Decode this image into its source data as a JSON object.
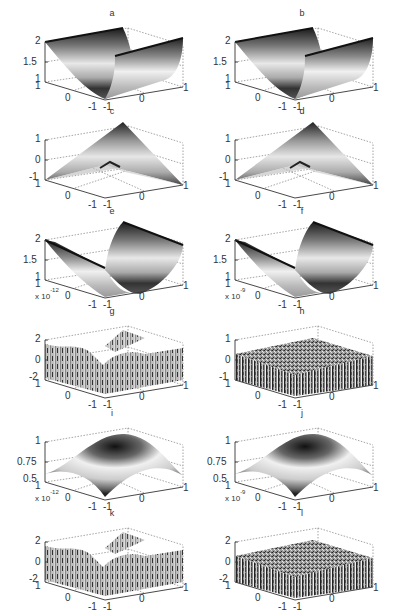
{
  "figure": {
    "layout": "6 rows x 2 columns of 3D surface plots",
    "panels": [
      {
        "id": "a",
        "title": "a",
        "type": "valley",
        "zticks": [
          "2",
          "1.5",
          "1"
        ],
        "yticks": [
          "1",
          "0",
          "-1"
        ],
        "xticks": [
          "-1",
          "0",
          "1"
        ],
        "exponent": ""
      },
      {
        "id": "b",
        "title": "b",
        "type": "valley",
        "zticks": [
          "2",
          "1.5",
          "1"
        ],
        "yticks": [
          "1",
          "0",
          "-1"
        ],
        "xticks": [
          "-1",
          "0",
          "1"
        ],
        "exponent": ""
      },
      {
        "id": "c",
        "title": "c",
        "type": "pyramid",
        "zticks": [
          "1",
          "0",
          "-1"
        ],
        "yticks": [
          "1",
          "0",
          "-1"
        ],
        "xticks": [
          "-1",
          "0",
          "1"
        ],
        "exponent": ""
      },
      {
        "id": "d",
        "title": "d",
        "type": "pyramid",
        "zticks": [
          "1",
          "0",
          "-1"
        ],
        "yticks": [
          "1",
          "0",
          "-1"
        ],
        "xticks": [
          "-1",
          "0",
          "1"
        ],
        "exponent": ""
      },
      {
        "id": "e",
        "title": "e",
        "type": "valley2",
        "zticks": [
          "2",
          "1.5",
          "1"
        ],
        "yticks": [
          "1",
          "0",
          "-1"
        ],
        "xticks": [
          "-1",
          "0",
          "1"
        ],
        "exponent": ""
      },
      {
        "id": "f",
        "title": "f",
        "type": "valley2",
        "zticks": [
          "2",
          "1.5",
          "1"
        ],
        "yticks": [
          "1",
          "0",
          "-1"
        ],
        "xticks": [
          "-1",
          "0",
          "1"
        ],
        "exponent": ""
      },
      {
        "id": "g",
        "title": "g",
        "type": "noise-wave",
        "zticks": [
          "2",
          "0",
          "-2"
        ],
        "yticks": [
          "1",
          "0",
          "-1"
        ],
        "xticks": [
          "-1",
          "0",
          "1"
        ],
        "exponent": "x 10",
        "exponent_power": "-12"
      },
      {
        "id": "h",
        "title": "h",
        "type": "noise",
        "zticks": [
          "1",
          "0",
          "-1"
        ],
        "yticks": [
          "1",
          "0",
          "-1"
        ],
        "xticks": [
          "-1",
          "0",
          "1"
        ],
        "exponent": "x 10",
        "exponent_power": "-9"
      },
      {
        "id": "i",
        "title": "i",
        "type": "dome",
        "zticks": [
          "1",
          "0.75",
          "0.5"
        ],
        "yticks": [
          "1",
          "0",
          "-1"
        ],
        "xticks": [
          "-1",
          "0",
          "1"
        ],
        "exponent": ""
      },
      {
        "id": "j",
        "title": "j",
        "type": "dome",
        "zticks": [
          "1",
          "0.75",
          "0.5"
        ],
        "yticks": [
          "1",
          "0",
          "-1"
        ],
        "xticks": [
          "-1",
          "0",
          "1"
        ],
        "exponent": ""
      },
      {
        "id": "k",
        "title": "k",
        "type": "noise-wave",
        "zticks": [
          "2",
          "0",
          "-2"
        ],
        "yticks": [
          "1",
          "0",
          "-1"
        ],
        "xticks": [
          "-1",
          "0",
          "1"
        ],
        "exponent": "x 10",
        "exponent_power": "-12"
      },
      {
        "id": "l",
        "title": "l",
        "type": "noise",
        "zticks": [
          "2",
          "0",
          "-2"
        ],
        "yticks": [
          "1",
          "0",
          "-1"
        ],
        "xticks": [
          "-1",
          "0",
          "1"
        ],
        "exponent": "x 10",
        "exponent_power": "-9"
      }
    ]
  },
  "chart_data": [
    {
      "type": "surface",
      "title": "a",
      "description": "parabolic valley z = 1 + x^2 along one axis",
      "x_range": [
        -1,
        1
      ],
      "y_range": [
        -1,
        1
      ],
      "zlim": [
        1,
        2
      ],
      "zticks": [
        1,
        1.5,
        2
      ],
      "xticks": [
        -1,
        0,
        1
      ],
      "yticks": [
        -1,
        0,
        1
      ],
      "grid": true
    },
    {
      "type": "surface",
      "title": "b",
      "description": "parabolic valley z = 1 + x^2 (approximation of a)",
      "x_range": [
        -1,
        1
      ],
      "y_range": [
        -1,
        1
      ],
      "zlim": [
        1,
        2
      ],
      "zticks": [
        1,
        1.5,
        2
      ],
      "xticks": [
        -1,
        0,
        1
      ],
      "yticks": [
        -1,
        0,
        1
      ],
      "grid": true
    },
    {
      "type": "surface",
      "title": "c",
      "description": "pyramid / saddle ridge surface",
      "x_range": [
        -1,
        1
      ],
      "y_range": [
        -1,
        1
      ],
      "zlim": [
        -1,
        1
      ],
      "zticks": [
        -1,
        0,
        1
      ],
      "xticks": [
        -1,
        0,
        1
      ],
      "yticks": [
        -1,
        0,
        1
      ],
      "grid": true
    },
    {
      "type": "surface",
      "title": "d",
      "description": "pyramid / saddle ridge surface (approximation of c)",
      "x_range": [
        -1,
        1
      ],
      "y_range": [
        -1,
        1
      ],
      "zlim": [
        -1,
        1
      ],
      "zticks": [
        -1,
        0,
        1
      ],
      "xticks": [
        -1,
        0,
        1
      ],
      "yticks": [
        -1,
        0,
        1
      ],
      "grid": true
    },
    {
      "type": "surface",
      "title": "e",
      "description": "parabolic valley z = 1 + y^2 along other axis",
      "x_range": [
        -1,
        1
      ],
      "y_range": [
        -1,
        1
      ],
      "zlim": [
        1,
        2
      ],
      "zticks": [
        1,
        1.5,
        2
      ],
      "xticks": [
        -1,
        0,
        1
      ],
      "yticks": [
        -1,
        0,
        1
      ],
      "grid": true
    },
    {
      "type": "surface",
      "title": "f",
      "description": "parabolic valley z = 1 + y^2 (approximation of e)",
      "x_range": [
        -1,
        1
      ],
      "y_range": [
        -1,
        1
      ],
      "zlim": [
        1,
        2
      ],
      "zticks": [
        1,
        1.5,
        2
      ],
      "xticks": [
        -1,
        0,
        1
      ],
      "yticks": [
        -1,
        0,
        1
      ],
      "grid": true
    },
    {
      "type": "surface",
      "title": "g",
      "description": "error surface, noisy with wave structure",
      "x_range": [
        -1,
        1
      ],
      "y_range": [
        -1,
        1
      ],
      "zlim": [
        -2e-12,
        2e-12
      ],
      "zticks": [
        -2,
        0,
        2
      ],
      "z_scale": "x 10^-12",
      "xticks": [
        -1,
        0,
        1
      ],
      "yticks": [
        -1,
        0,
        1
      ],
      "grid": true
    },
    {
      "type": "surface",
      "title": "h",
      "description": "error surface, random noise",
      "x_range": [
        -1,
        1
      ],
      "y_range": [
        -1,
        1
      ],
      "zlim": [
        -1e-09,
        1e-09
      ],
      "zticks": [
        -1,
        0,
        1
      ],
      "z_scale": "x 10^-9",
      "xticks": [
        -1,
        0,
        1
      ],
      "yticks": [
        -1,
        0,
        1
      ],
      "grid": true
    },
    {
      "type": "surface",
      "title": "i",
      "description": "dome surface",
      "x_range": [
        -1,
        1
      ],
      "y_range": [
        -1,
        1
      ],
      "zlim": [
        0.5,
        1
      ],
      "zticks": [
        0.5,
        0.75,
        1
      ],
      "xticks": [
        -1,
        0,
        1
      ],
      "yticks": [
        -1,
        0,
        1
      ],
      "grid": true
    },
    {
      "type": "surface",
      "title": "j",
      "description": "dome surface (approximation of i)",
      "x_range": [
        -1,
        1
      ],
      "y_range": [
        -1,
        1
      ],
      "zlim": [
        0.5,
        1
      ],
      "zticks": [
        0.5,
        0.75,
        1
      ],
      "xticks": [
        -1,
        0,
        1
      ],
      "yticks": [
        -1,
        0,
        1
      ],
      "grid": true
    },
    {
      "type": "surface",
      "title": "k",
      "description": "error surface, noisy with wave structure",
      "x_range": [
        -1,
        1
      ],
      "y_range": [
        -1,
        1
      ],
      "zlim": [
        -2e-12,
        2e-12
      ],
      "zticks": [
        -2,
        0,
        2
      ],
      "z_scale": "x 10^-12",
      "xticks": [
        -1,
        0,
        1
      ],
      "yticks": [
        -1,
        0,
        1
      ],
      "grid": true
    },
    {
      "type": "surface",
      "title": "l",
      "description": "error surface, random noise",
      "x_range": [
        -1,
        1
      ],
      "y_range": [
        -1,
        1
      ],
      "zlim": [
        -2e-09,
        2e-09
      ],
      "zticks": [
        -2,
        0,
        2
      ],
      "z_scale": "x 10^-9",
      "xticks": [
        -1,
        0,
        1
      ],
      "yticks": [
        -1,
        0,
        1
      ],
      "grid": true
    }
  ]
}
